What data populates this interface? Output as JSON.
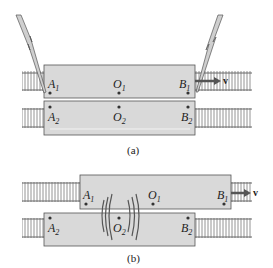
{
  "figure_a": {
    "caption": "(a)",
    "car1": {
      "points": [
        {
          "name": "A",
          "sub": "1"
        },
        {
          "name": "O",
          "sub": "1"
        },
        {
          "name": "B",
          "sub": "1"
        }
      ]
    },
    "car2": {
      "points": [
        {
          "name": "A",
          "sub": "2"
        },
        {
          "name": "O",
          "sub": "2"
        },
        {
          "name": "B",
          "sub": "2"
        }
      ]
    },
    "velocity_label": "v",
    "lightning_bolts": 2
  },
  "figure_b": {
    "caption": "(b)",
    "car1": {
      "points": [
        {
          "name": "A",
          "sub": "1"
        },
        {
          "name": "O",
          "sub": "1"
        },
        {
          "name": "B",
          "sub": "1"
        }
      ]
    },
    "car2": {
      "points": [
        {
          "name": "A",
          "sub": "2"
        },
        {
          "name": "O",
          "sub": "2"
        },
        {
          "name": "B",
          "sub": "2"
        }
      ]
    },
    "velocity_label": "v"
  },
  "colors": {
    "car_fill": "#d9d9d9",
    "car_stroke": "#555555",
    "rail": "#666666",
    "bolt_fill": "#cfcfcf",
    "wave": "#555555"
  }
}
